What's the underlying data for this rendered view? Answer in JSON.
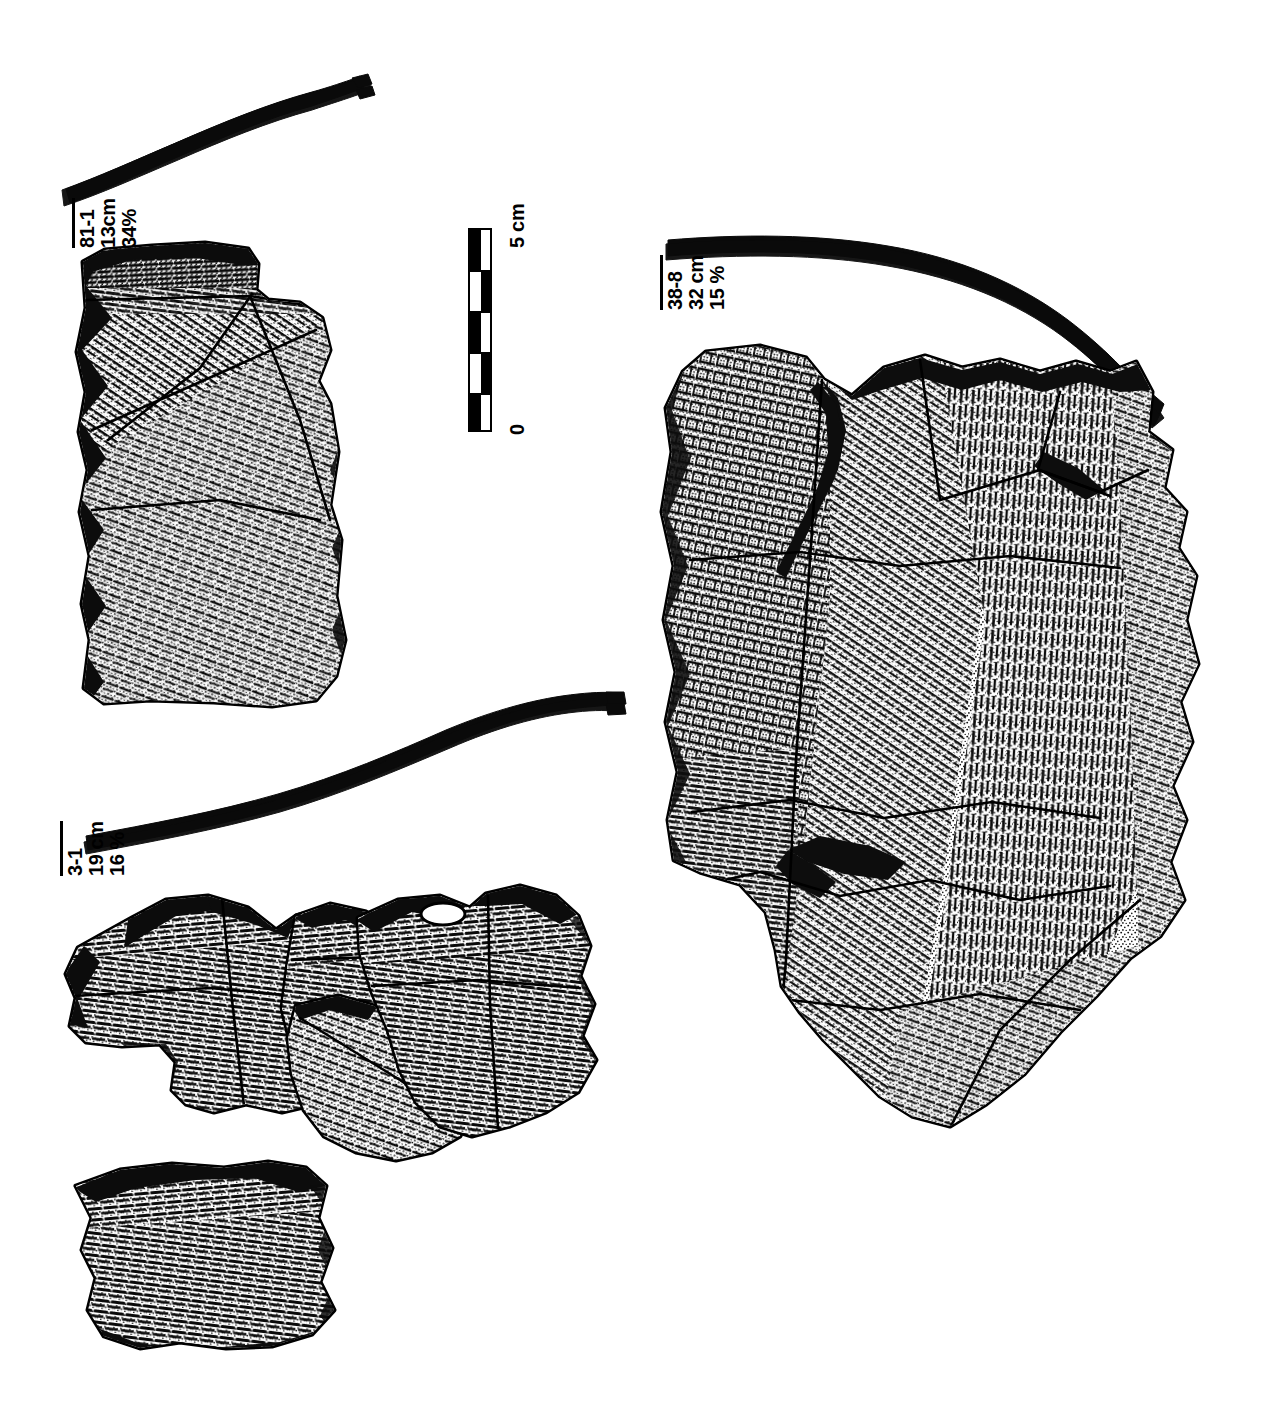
{
  "plate": {
    "description": "Archaeological illustration plate of three cord-marked pottery rim sherds with rim-profile cross-sections and a vertical scale bar",
    "background_color": "#ffffff",
    "ink_color": "#000000",
    "width": 1278,
    "height": 1428
  },
  "scale": {
    "top_label": "5 cm",
    "bottom_label": "0",
    "units": "cm",
    "max_value": 5,
    "min_value": 0,
    "divisions": 5,
    "orientation": "vertical",
    "style": "alternating black and white checkered segments"
  },
  "specimens": [
    {
      "id": "sherd-81-1",
      "catalog": "81-1",
      "diameter": "13cm",
      "percent": "34%",
      "position": "upper-left",
      "profile_shape": "s-curve everted rim, flat-lying",
      "surface_treatment": "diagonal cord-marked with stippled shading",
      "fragment_count": 1
    },
    {
      "id": "sherd-3-1",
      "catalog": "3-1",
      "diameter": "19 cm",
      "percent": "16 %",
      "position": "lower-left",
      "profile_shape": "long shallow s-curve rising to the right",
      "surface_treatment": "horizontal cord-marked bands, refitted sherd cluster",
      "fragment_count": 6
    },
    {
      "id": "sherd-38-8",
      "catalog": "38-8",
      "diameter": "32 cm",
      "percent": "15 %",
      "position": "right",
      "profile_shape": "flaring rim arcing down to the right",
      "surface_treatment": "mixed cross-hatched and vertical cord-marked zones",
      "fragment_count": 4
    }
  ]
}
